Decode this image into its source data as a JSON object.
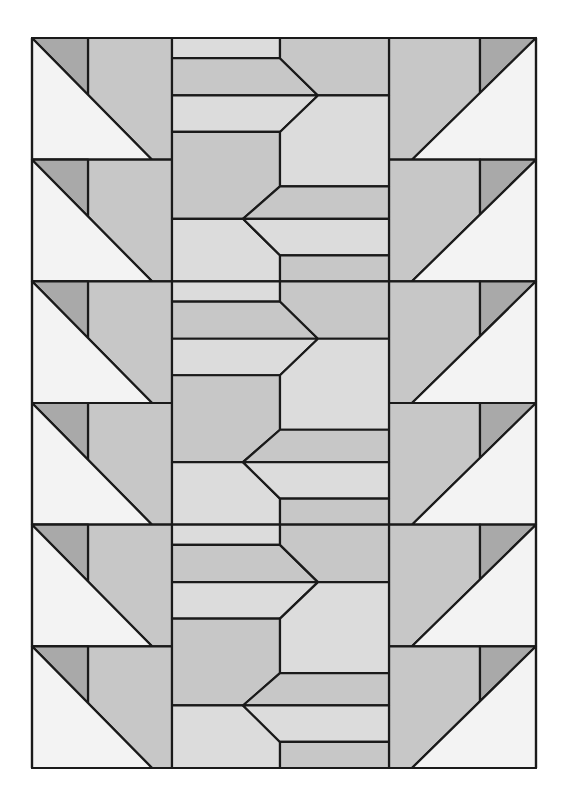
{
  "colors": {
    "outline": "#1a1a1a",
    "dark": "#a9a9a9",
    "medium": "#c7c7c7",
    "light": "#dcdcdc",
    "pale": "#f3f3f3",
    "background": "#ffffff"
  },
  "layout": {
    "row_count": 6,
    "side_blocks": [
      "left",
      "right"
    ],
    "center_cycles": 3
  },
  "center_pieces": [
    {
      "side": "left",
      "shape": "bar",
      "tone": "light"
    },
    {
      "side": "right",
      "shape": "pentagon",
      "tone": "medium"
    },
    {
      "side": "left",
      "shape": "chevron",
      "tone": "medium"
    },
    {
      "side": "left",
      "shape": "chevron",
      "tone": "light"
    },
    {
      "side": "right",
      "shape": "pentagon",
      "tone": "light"
    },
    {
      "side": "left",
      "shape": "pentagon",
      "tone": "medium"
    },
    {
      "side": "right",
      "shape": "chevron",
      "tone": "medium"
    },
    {
      "side": "right",
      "shape": "chevron",
      "tone": "light"
    }
  ]
}
